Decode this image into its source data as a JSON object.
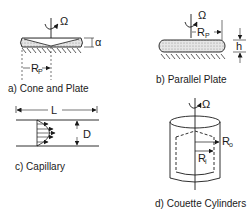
{
  "diagram": {
    "panels": [
      {
        "id": "a",
        "caption": "a) Cone and Plate",
        "labels": {
          "rotation": "Ω",
          "angle": "α",
          "radius": "R",
          "radius_sub": "P"
        }
      },
      {
        "id": "b",
        "caption": "b) Parallel Plate",
        "labels": {
          "rotation": "Ω",
          "radius": "R",
          "radius_sub": "P",
          "gap": "h"
        }
      },
      {
        "id": "c",
        "caption": "c) Capillary",
        "labels": {
          "length": "L",
          "diameter": "D"
        }
      },
      {
        "id": "d",
        "caption": "d) Couette Cylinders",
        "labels": {
          "rotation": "Ω",
          "outer_radius": "R",
          "outer_sub": "o",
          "inner_radius": "R",
          "inner_sub": "i"
        }
      }
    ],
    "colors": {
      "ink": "#1a1a1a",
      "fill": "#d9d9d9",
      "background": "#ffffff"
    }
  }
}
